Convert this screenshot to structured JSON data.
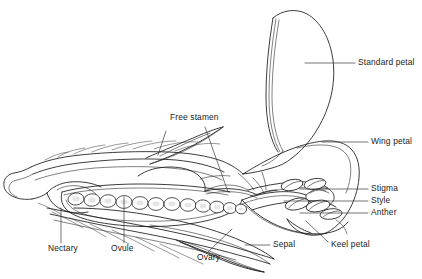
{
  "figure": {
    "kind": "botanical-line-diagram",
    "style": "black ink line drawing on white background",
    "width": 422,
    "height": 279,
    "ink_color": "#1a1a1a",
    "background_color": "#ffffff"
  },
  "labels": {
    "standard_petal": "Standard petal",
    "wing_petal": "Wing petal",
    "stigma": "Stigma",
    "style": "Style",
    "anther": "Anther",
    "keel_petal": "Keel petal",
    "sepal": "Sepal",
    "ovary": "Ovary",
    "ovule": "Ovule",
    "nectary": "Nectary",
    "free_stamen": "Free stamen"
  },
  "label_positions": [
    {
      "name": "standard-petal",
      "text": "Standard petal",
      "x": 358,
      "y": 62,
      "leader": "horizontal-left-to-petal"
    },
    {
      "name": "wing-petal",
      "text": "Wing petal",
      "x": 371,
      "y": 141,
      "leader": "horizontal-left-to-wing"
    },
    {
      "name": "stigma",
      "text": "Stigma",
      "x": 371,
      "y": 185,
      "leader": "horizontal-left-to-stigma"
    },
    {
      "name": "style",
      "text": "Style",
      "x": 371,
      "y": 197,
      "leader": "horizontal-left-to-style"
    },
    {
      "name": "anther",
      "text": "Anther",
      "x": 371,
      "y": 209,
      "leader": "horizontal-left-to-anther"
    },
    {
      "name": "keel-petal",
      "text": "Keel petal",
      "x": 331,
      "y": 245,
      "leader": "diagonal-up-left-to-keel"
    },
    {
      "name": "sepal",
      "text": "Sepal",
      "x": 272,
      "y": 241,
      "leader": "horizontal-left-to-sepal"
    },
    {
      "name": "ovary",
      "text": "Ovary",
      "x": 197,
      "y": 258,
      "leader": "diagonal-up-right-to-ovary"
    },
    {
      "name": "ovule",
      "text": "Ovule",
      "x": 112,
      "y": 249,
      "leader": "vertical-up-to-ovule"
    },
    {
      "name": "nectary",
      "text": "Nectary",
      "x": 50,
      "y": 249,
      "leader": "vertical-up-to-nectary"
    },
    {
      "name": "free-stamen",
      "text": "Free stamen",
      "x": 172,
      "y": 118,
      "leader": "diagonal-down-right-to-stamen"
    }
  ],
  "anatomy": {
    "ovule_count": 12,
    "anther_count": 5,
    "sepal_hair_count": 14,
    "parts": [
      "Standard petal",
      "Wing petal",
      "Keel petal",
      "Sepal",
      "Ovary",
      "Ovule",
      "Nectary",
      "Free stamen",
      "Stigma",
      "Style",
      "Anther"
    ]
  }
}
